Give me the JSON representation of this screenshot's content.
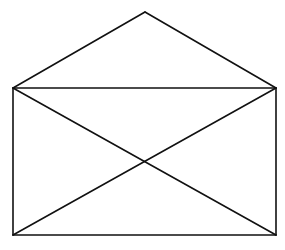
{
  "diagram": {
    "stroke_color": "#111111",
    "background": "#ffffff",
    "stroke_width": 1.6,
    "points": {
      "apex": [
        145,
        12
      ],
      "top_left": [
        13,
        88
      ],
      "top_right": [
        276,
        88
      ],
      "bottom_left": [
        13,
        235
      ],
      "bottom_right": [
        276,
        235
      ],
      "center": [
        145,
        161
      ]
    },
    "segments": [
      {
        "name": "flap-left-edge",
        "from": "top_left",
        "to": "apex"
      },
      {
        "name": "flap-right-edge",
        "from": "apex",
        "to": "top_right"
      },
      {
        "name": "rect-top-edge",
        "from": "top_left",
        "to": "top_right"
      },
      {
        "name": "rect-right-edge",
        "from": "top_right",
        "to": "bottom_right"
      },
      {
        "name": "rect-bottom-edge",
        "from": "bottom_right",
        "to": "bottom_left"
      },
      {
        "name": "rect-left-edge",
        "from": "bottom_left",
        "to": "top_left"
      },
      {
        "name": "diagonal-tl-br",
        "from": "top_left",
        "to": "bottom_right"
      },
      {
        "name": "diagonal-tr-bl",
        "from": "top_right",
        "to": "bottom_left"
      }
    ]
  }
}
